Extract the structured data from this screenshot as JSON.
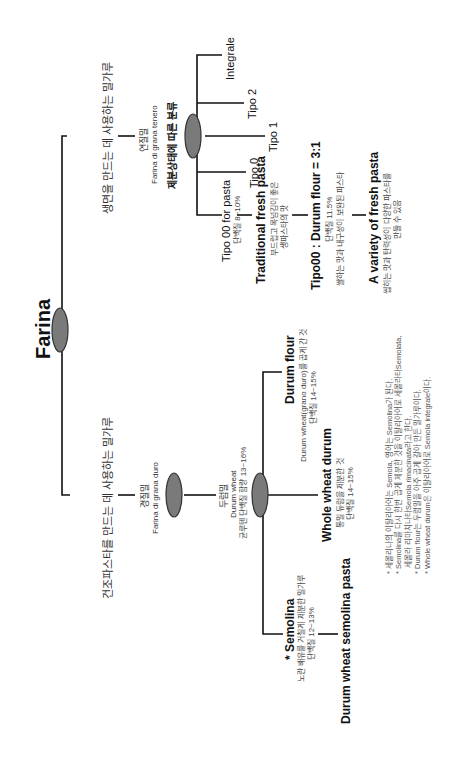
{
  "root": {
    "label": "Farina"
  },
  "fresh_branch": {
    "label": "생면을 만드는 데 사용하는 밀가루",
    "node": {
      "ko": "연질밀",
      "it": "Farina di grana tenero",
      "classification": "제분상태에 따른 분류"
    },
    "grades": [
      {
        "label": "Integrale"
      },
      {
        "label": "Tipo 2"
      },
      {
        "label": "Tipo 1"
      },
      {
        "label": "Tipo 0"
      },
      {
        "label": "Tipo 00 for pasta",
        "sub": "단백질 8~10%"
      }
    ],
    "chain": [
      {
        "title": "Traditional fresh pasta",
        "lines": [
          "부드럽고 목넘김이 좋은",
          "생파스타의 맛"
        ]
      },
      {
        "title": "Tipo00 : Durum flour = 3:1",
        "lines": [
          "단백질 11.5%",
          "쌀하는 맛과 내구성이 보완된 파스타"
        ]
      },
      {
        "title": "A variety of fresh pasta",
        "lines": [
          "씹히는 맛과 탄력성이 다양한 파스타를",
          "만들 수 있음"
        ]
      }
    ]
  },
  "dry_branch": {
    "label": "건조파스타를 만드는 데 사용하는 밀가루",
    "node": {
      "ko": "경질밀",
      "it": "Farina di grana duro"
    },
    "durum": {
      "ko": "두럼밀",
      "en": "Durum wheat",
      "sub": "균루텐 단백질 함량 13~16%"
    },
    "products": [
      {
        "title": "Durum flour",
        "lines": [
          "Durum wheat(grano duro)를 곱게 간 것",
          "단백질 14~15%"
        ]
      },
      {
        "title": "Whole wheat durum",
        "lines": [
          "통밀 듀럼을 제분한 것",
          "단백질 14~15%"
        ]
      },
      {
        "title": "* Semolina",
        "lines": [
          "노란 배유를 거칠게 제분한 밀가루",
          "단백질 12~13%"
        ]
      }
    ],
    "result": {
      "title": "Durum wheat semolina pasta"
    }
  },
  "footnotes": [
    "* 세몰리나의 이탈리아어는 Semola, 영어는 Semolina가 된다.",
    "* Semolina를 다시 한번 곱게 제분한 것을 이탈리아어로 세몰라타Semolata,",
    "  세몰라 리마치나타Semola rimacinata라고 한다.",
    "* Durum flour는 두럼밀을 아주 곱게 갈아 만든 밀가루이다.",
    "* Whole wheat durum은 이탈리아어로 Semola integrale이다."
  ],
  "colors": {
    "node_fill": "#7a7a7a",
    "node_stroke": "#333333",
    "line": "#111111"
  }
}
